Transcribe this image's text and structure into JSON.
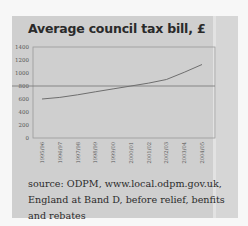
{
  "title": "Average council tax bill, £",
  "source_text": "source: ODPM, www.local.odpm.gov.uk, England at Band D, before relief, benfits and rebates",
  "colors": {
    "panel_background": "#cfcfcf",
    "line": "#6e6e6e",
    "reference_line": "#7d7d7d",
    "text": "#2a2a2a"
  },
  "chart_data": {
    "type": "line",
    "title": "Average council tax bill, £",
    "xlabel": "",
    "ylabel": "",
    "categories": [
      "1995/96",
      "1996/97",
      "1997/98",
      "1998/99",
      "1999/00",
      "2000/01",
      "2001/02",
      "2002/03",
      "2003/04",
      "2004/05"
    ],
    "series": [
      {
        "name": "Average council tax bill (£)",
        "values": [
          600,
          625,
          665,
          710,
          755,
          800,
          845,
          900,
          1010,
          1130
        ]
      }
    ],
    "yticks": [
      0,
      200,
      400,
      600,
      800,
      1000,
      1200,
      1400
    ],
    "ylim": [
      0,
      1400
    ],
    "reference_line": 800,
    "grid": false,
    "legend": "none",
    "note": "source: ODPM, www.local.odpm.gov.uk, England at Band D, before relief, benfits and rebates"
  }
}
